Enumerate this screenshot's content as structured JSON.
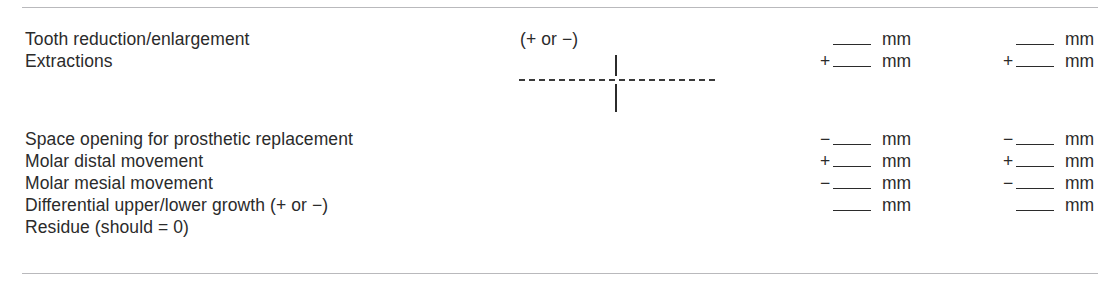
{
  "form": {
    "rules": {
      "top_label": "top-divider",
      "bottom_label": "bottom-divider"
    },
    "group_a": {
      "rows": [
        {
          "label": "Tooth reduction/enlargement",
          "note": "(+ or −)",
          "col3_sign": "",
          "col3_unit": "mm",
          "col4_sign": "",
          "col4_unit": "mm"
        },
        {
          "label": "Extractions",
          "note": "",
          "col3_sign": "+",
          "col3_unit": "mm",
          "col4_sign": "+",
          "col4_unit": "mm"
        }
      ]
    },
    "group_b": {
      "rows": [
        {
          "label": "Space opening for prosthetic replacement",
          "col3_sign": "−",
          "col3_unit": "mm",
          "col4_sign": "−",
          "col4_unit": "mm"
        },
        {
          "label": "Molar distal movement",
          "col3_sign": "+",
          "col3_unit": "mm",
          "col4_sign": "+",
          "col4_unit": "mm"
        },
        {
          "label": "Molar mesial movement",
          "col3_sign": "−",
          "col3_unit": "mm",
          "col4_sign": "−",
          "col4_unit": "mm"
        },
        {
          "label": "Differential upper/lower growth (+ or −)",
          "col3_sign": "",
          "col3_unit": "mm",
          "col4_sign": "",
          "col4_unit": "mm"
        },
        {
          "label": "Residue (should = 0)",
          "col3_sign": "",
          "col3_unit": "",
          "col4_sign": "",
          "col4_unit": ""
        }
      ]
    },
    "cross_figure": {
      "name": "axis-cross-diagram"
    },
    "colors": {
      "text": "#2b2b2b",
      "rule": "#b9b9bc",
      "background": "#ffffff"
    }
  }
}
